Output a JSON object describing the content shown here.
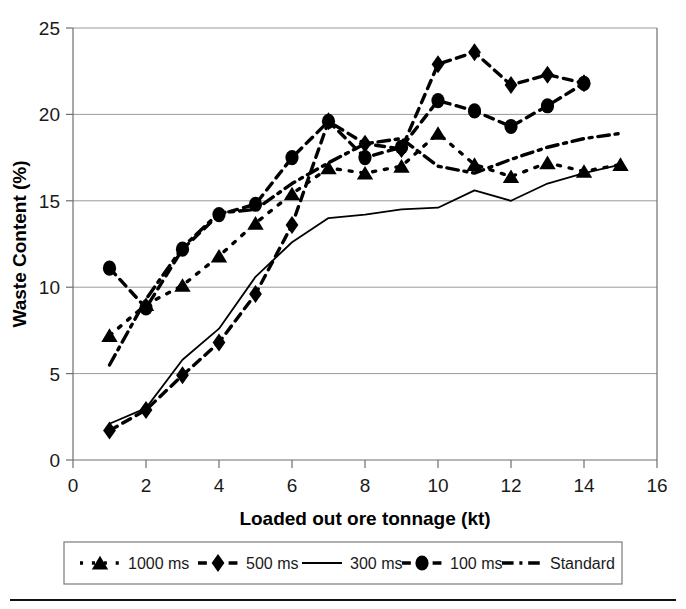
{
  "chart_data": {
    "type": "line",
    "title": "",
    "xlabel": "Loaded out ore tonnage (kt)",
    "ylabel": "Waste Content (%)",
    "xlim": [
      0,
      16
    ],
    "ylim": [
      0,
      25
    ],
    "xticks": [
      0,
      2,
      4,
      6,
      8,
      10,
      12,
      14,
      16
    ],
    "yticks": [
      0,
      5,
      10,
      15,
      20,
      25
    ],
    "grid": "horizontal",
    "legend_position": "below-axis",
    "series": [
      {
        "name": "1000 ms",
        "marker": "triangle",
        "linestyle": "dotted",
        "color": "#000000",
        "x": [
          1,
          2,
          3,
          4,
          5,
          6,
          7,
          8,
          9,
          10,
          11,
          12,
          13,
          14,
          15
        ],
        "values": [
          7.2,
          9.0,
          10.1,
          11.8,
          13.7,
          15.4,
          16.9,
          16.6,
          17.0,
          18.9,
          17.1,
          16.4,
          17.2,
          16.7,
          17.1
        ]
      },
      {
        "name": "500 ms",
        "marker": "diamond",
        "linestyle": "dashed",
        "color": "#000000",
        "x": [
          1,
          2,
          3,
          4,
          5,
          6,
          7,
          8,
          9,
          10,
          11,
          12,
          13,
          14
        ],
        "values": [
          1.7,
          2.9,
          4.9,
          6.8,
          9.6,
          13.6,
          19.6,
          18.3,
          18.0,
          22.9,
          23.6,
          21.7,
          22.3,
          21.8
        ]
      },
      {
        "name": "300 ms",
        "marker": "none",
        "linestyle": "solid",
        "color": "#000000",
        "x": [
          1,
          2,
          3,
          4,
          5,
          6,
          7,
          8,
          9,
          10,
          11,
          12,
          13,
          14,
          15
        ],
        "values": [
          2.1,
          3.0,
          5.8,
          7.6,
          10.6,
          12.6,
          14.0,
          14.2,
          14.5,
          14.6,
          15.6,
          15.0,
          16.0,
          16.6,
          17.1
        ]
      },
      {
        "name": "100 ms",
        "marker": "circle",
        "linestyle": "dashed",
        "color": "#000000",
        "x": [
          1,
          2,
          3,
          4,
          5,
          6,
          7,
          8,
          9,
          10,
          11,
          12,
          13,
          14
        ],
        "values": [
          11.1,
          8.8,
          12.2,
          14.2,
          14.8,
          17.5,
          19.6,
          17.5,
          18.1,
          20.8,
          20.2,
          19.3,
          20.5,
          21.8
        ]
      },
      {
        "name": "Standard",
        "marker": "none",
        "linestyle": "dashdot",
        "color": "#000000",
        "x": [
          1,
          2,
          3,
          4,
          5,
          6,
          7,
          8,
          9,
          10,
          11,
          12,
          13,
          14,
          15
        ],
        "values": [
          5.5,
          9.3,
          12.3,
          14.3,
          14.5,
          16.0,
          17.2,
          18.3,
          18.6,
          17.0,
          16.6,
          17.4,
          18.1,
          18.6,
          18.9
        ]
      }
    ]
  },
  "legend": {
    "items": [
      {
        "label": "1000 ms",
        "marker": "triangle",
        "linestyle": "dotted"
      },
      {
        "label": "500 ms",
        "marker": "diamond",
        "linestyle": "dashed"
      },
      {
        "label": "300 ms",
        "marker": "none",
        "linestyle": "solid"
      },
      {
        "label": "100 ms",
        "marker": "circle",
        "linestyle": "dashed"
      },
      {
        "label": "Standard",
        "marker": "none",
        "linestyle": "dashdot"
      }
    ]
  }
}
